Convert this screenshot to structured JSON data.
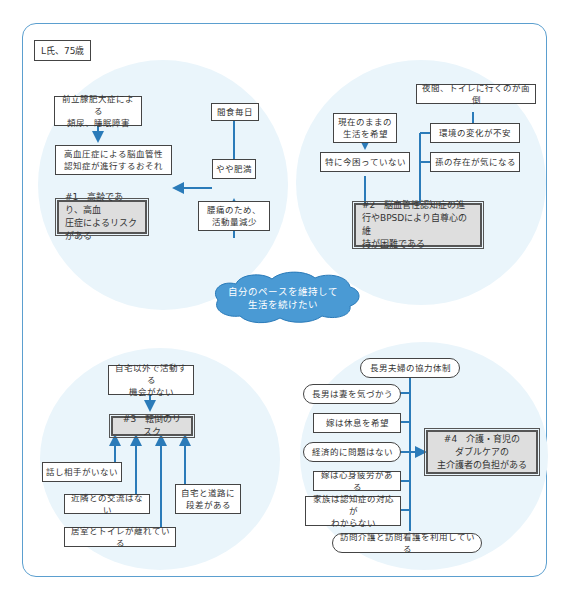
{
  "patient_label": "L氏、75歳",
  "center_goal": "自分のペースを維持して\n生活を続けたい",
  "colors": {
    "frame": "#5b9fcf",
    "arrow": "#2b7bb9",
    "circle_fill": "#eaf5fb",
    "cloud_fill": "#4a9ad4",
    "problem_fill": "#dedede"
  },
  "quadrant1": {
    "factors": {
      "prostate": "前立腺肥大症による\n頻尿、睡眠障害",
      "snacking": "間食毎日",
      "dementia_risk": "高血圧症による脳血管性\n認知症が進行するおそれ",
      "overweight": "やや肥満",
      "back_pain": "腰痛のため、\n活動量減少"
    },
    "problem": "#1　高齢であり、高血\n圧症によるリスクがある"
  },
  "quadrant2": {
    "factors": {
      "night_toilet": "夜間、トイレに行くのが面倒",
      "current_life": "現在のままの\n生活を希望",
      "env_change": "環境の変化が不安",
      "not_troubled": "特に今困っていない",
      "grandchild": "孫の存在が気になる"
    },
    "problem": "#2　脳血管性認知症の進\n行やBPSDにより自尊心の維\n持が困難である"
  },
  "quadrant3": {
    "factors": {
      "no_outside_activity": "自宅以外で活動する\n機会がない",
      "no_talk_partner": "話し相手がいない",
      "no_neighbors": "近隣との交流はない",
      "step_to_road": "自宅と道路に\n段差がある",
      "toilet_far": "居室とトイレが離れている"
    },
    "problem": "#3　転倒のリスク"
  },
  "quadrant4": {
    "factors": {
      "son_couple": "長男夫婦の協力体制",
      "son_cares_wife": "長男は妻を気づかう",
      "daughter_rest": "嫁は休息を希望",
      "no_financial": "経済的に問題はない",
      "daughter_fatigue": "嫁は心身疲労がある",
      "family_unknown": "家族は認知症の対応が\nわからない",
      "home_care": "訪問介護と訪問看護を利用している"
    },
    "problem": "#4　介護・育児の\nダブルケアの\n主介護者の負担がある"
  }
}
